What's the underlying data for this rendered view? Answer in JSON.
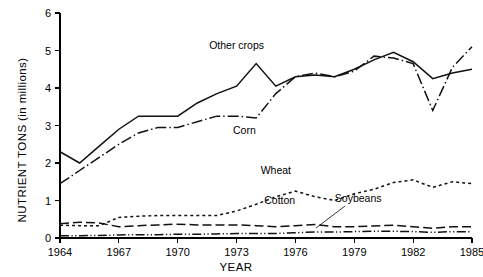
{
  "chart_data": {
    "type": "line",
    "title": "",
    "xlabel": "YEAR",
    "ylabel": "NUTRIENT TONS  (in millions)",
    "xlim": [
      1964,
      1985
    ],
    "ylim": [
      0,
      6
    ],
    "grid": false,
    "legend_position": "inline-annotations",
    "x_ticks": [
      "1964",
      "1967",
      "1970",
      "1973",
      "1976",
      "1979",
      "1982",
      "1985"
    ],
    "y_ticks": [
      "0",
      "1",
      "2",
      "3",
      "4",
      "5",
      "6"
    ],
    "x": [
      1964,
      1965,
      1966,
      1967,
      1968,
      1969,
      1970,
      1971,
      1972,
      1973,
      1974,
      1975,
      1976,
      1977,
      1978,
      1979,
      1980,
      1981,
      1982,
      1983,
      1984,
      1985
    ],
    "series": [
      {
        "name": "Other crops",
        "style": "solid",
        "values": [
          2.3,
          2.0,
          2.45,
          2.9,
          3.25,
          3.25,
          3.25,
          3.6,
          3.85,
          4.05,
          4.65,
          4.05,
          4.3,
          4.35,
          4.3,
          4.5,
          4.75,
          4.95,
          4.7,
          4.25,
          4.4,
          4.5
        ]
      },
      {
        "name": "Corn",
        "style": "dash-dot",
        "values": [
          1.45,
          1.8,
          2.15,
          2.5,
          2.8,
          2.95,
          2.95,
          3.1,
          3.25,
          3.25,
          3.2,
          3.85,
          4.3,
          4.4,
          4.3,
          4.45,
          4.85,
          4.8,
          4.65,
          3.4,
          4.55,
          5.1
        ]
      },
      {
        "name": "Wheat",
        "style": "dotted",
        "values": [
          0.34,
          0.33,
          0.33,
          0.55,
          0.58,
          0.6,
          0.6,
          0.6,
          0.6,
          0.72,
          0.9,
          1.1,
          1.25,
          1.1,
          1.0,
          1.18,
          1.3,
          1.48,
          1.55,
          1.35,
          1.5,
          1.45
        ]
      },
      {
        "name": "Cotton",
        "style": "dashed",
        "values": [
          0.38,
          0.42,
          0.4,
          0.3,
          0.33,
          0.35,
          0.37,
          0.35,
          0.35,
          0.35,
          0.33,
          0.3,
          0.33,
          0.36,
          0.3,
          0.3,
          0.32,
          0.34,
          0.3,
          0.26,
          0.3,
          0.3
        ]
      },
      {
        "name": "Soybeans",
        "style": "dash-dot-dot",
        "values": [
          0.06,
          0.06,
          0.07,
          0.08,
          0.09,
          0.09,
          0.1,
          0.1,
          0.11,
          0.12,
          0.12,
          0.12,
          0.14,
          0.16,
          0.16,
          0.17,
          0.18,
          0.18,
          0.17,
          0.15,
          0.17,
          0.17
        ]
      }
    ],
    "annotations": [
      {
        "name": "Other crops",
        "x": 1973.0,
        "y": 5.05
      },
      {
        "name": "Corn",
        "x": 1973.4,
        "y": 2.78
      },
      {
        "name": "Wheat",
        "x": 1975.0,
        "y": 1.72
      },
      {
        "name": "Cotton",
        "x": 1975.2,
        "y": 0.92
      },
      {
        "name": "Soybeans",
        "x": 1979.2,
        "y": 0.95
      }
    ]
  },
  "colors": {
    "ink": "#111111",
    "axis": "#000000",
    "background": "#ffffff"
  }
}
